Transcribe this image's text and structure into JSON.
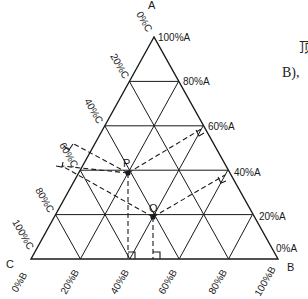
{
  "diagram": {
    "type": "ternary-phase-diagram",
    "vertices": {
      "top": "A",
      "bottom_right": "B",
      "bottom_left": "C"
    },
    "a_axis_labels": [
      "100%A",
      "80%A",
      "60%A",
      "40%A",
      "20%A",
      "0%A"
    ],
    "c_axis_labels": [
      "0%C",
      "20%C",
      "40%C",
      "60%C",
      "80%C",
      "100%C"
    ],
    "b_axis_labels": [
      "0%B",
      "20%B",
      "40%B",
      "60%B",
      "80%B",
      "100%B"
    ],
    "points": [
      {
        "name": "P",
        "A": 40,
        "B": 40,
        "C": 20
      },
      {
        "name": "Q",
        "A": 20,
        "B": 50,
        "C": 30
      }
    ],
    "side_text": [
      "顶",
      "B),"
    ]
  },
  "colors": {
    "line": "#1a1a1a",
    "background": "#ffffff"
  }
}
